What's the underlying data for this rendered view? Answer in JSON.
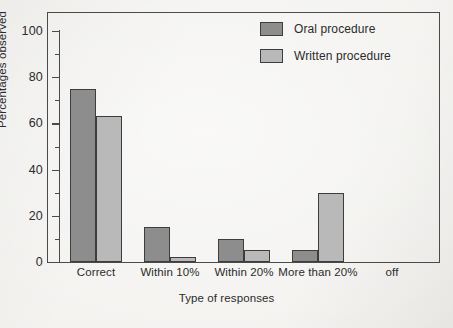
{
  "chart_data": {
    "type": "bar",
    "title": "",
    "xlabel": "Type of responses",
    "ylabel": "Percentages observed",
    "categories": [
      "Correct",
      "Within 10%",
      "Within 20%",
      "More than 20%",
      "off"
    ],
    "series": [
      {
        "name": "Oral procedure",
        "color": "#8d8d8d",
        "values": [
          75,
          15,
          10,
          5,
          0
        ]
      },
      {
        "name": "Written procedure",
        "color": "#b9b9b9",
        "values": [
          63,
          2,
          5,
          30,
          0
        ]
      }
    ],
    "ylim": [
      0,
      100
    ],
    "ytick_labels": [
      "0",
      "20",
      "40",
      "60",
      "80",
      "100"
    ],
    "ytick_values": [
      0,
      20,
      40,
      60,
      80,
      100
    ],
    "yminor_values": [
      10,
      30,
      50,
      70,
      90
    ],
    "grid": false,
    "legend_position": "top-right"
  },
  "legend": {
    "entries": [
      {
        "label": "Oral procedure",
        "swatch": "#8d8d8d"
      },
      {
        "label": "Written procedure",
        "swatch": "#b9b9b9"
      }
    ]
  }
}
